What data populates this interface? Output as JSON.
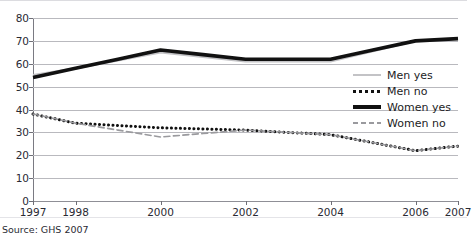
{
  "figure": {
    "title_fragment": "",
    "source": "Source: GHS 2007"
  },
  "legend": {
    "position": "middle-right",
    "items": [
      {
        "label": "Men yes",
        "icon": "line-solid-light-icon",
        "color": "#c3c3c6"
      },
      {
        "label": "Men no",
        "icon": "line-dotted-black-icon",
        "color": "#111111"
      },
      {
        "label": "Women yes",
        "icon": "line-thick-black-icon",
        "color": "#111111"
      },
      {
        "label": "Women no",
        "icon": "line-dashed-gray-icon",
        "color": "#9a9a9e"
      }
    ]
  },
  "axes": {
    "y_ticks": [
      "80",
      "70",
      "60",
      "50",
      "40",
      "30",
      "20",
      "10",
      "0"
    ],
    "x_ticks": [
      "1997",
      "1998",
      "2000",
      "2002",
      "2004",
      "2006",
      "2007"
    ]
  },
  "chart_data": {
    "type": "line",
    "title": "",
    "xlabel": "",
    "ylabel": "",
    "ylim": [
      0,
      80
    ],
    "ytick_step": 10,
    "grid": true,
    "legend_position": "middle-right",
    "categories": [
      "1997",
      "1998",
      "2000",
      "2002",
      "2004",
      "2006",
      "2007"
    ],
    "x_positions": [
      0,
      1,
      3,
      5,
      7,
      9,
      10
    ],
    "series": [
      {
        "name": "Men yes",
        "color": "#c3c3c6",
        "style": "solid-thin",
        "values": [
          55,
          58,
          65,
          61,
          61,
          70,
          71
        ]
      },
      {
        "name": "Men no",
        "color": "#111111",
        "style": "dotted",
        "values": [
          38,
          34,
          32,
          31,
          29,
          22,
          24
        ]
      },
      {
        "name": "Women yes",
        "color": "#111111",
        "style": "solid-thick",
        "values": [
          54,
          58,
          66,
          62,
          62,
          70,
          71
        ]
      },
      {
        "name": "Women no",
        "color": "#9a9a9e",
        "style": "dashed",
        "values": [
          38,
          34,
          28,
          31,
          29,
          22,
          24
        ]
      }
    ]
  }
}
